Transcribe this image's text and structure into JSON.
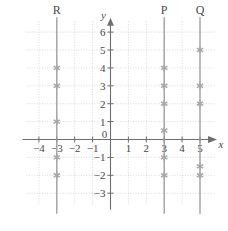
{
  "chart_data": {
    "type": "scatter",
    "title": "",
    "xlabel": "x",
    "ylabel": "y",
    "xlim": [
      -4.7,
      5.9
    ],
    "ylim": [
      -3.7,
      6.6
    ],
    "grid": true,
    "legend_position": "above-lines",
    "x_ticks": [
      -4,
      -3,
      -2,
      -1,
      0,
      1,
      2,
      3,
      4,
      5
    ],
    "x_tick_labels": [
      "−4",
      "−3",
      "−2",
      "−1",
      "0",
      "1",
      "2",
      "3",
      "4",
      "5"
    ],
    "y_ticks": [
      -3,
      -2,
      -1,
      1,
      2,
      3,
      4,
      5,
      6
    ],
    "y_tick_labels": [
      "−3",
      "−2",
      "−1",
      "1",
      "2",
      "3",
      "4",
      "5",
      "6"
    ],
    "series": [
      {
        "name": "R",
        "label": "R",
        "line_x": -3,
        "label_y": 6.6,
        "points": [
          {
            "x": -3,
            "y": 4
          },
          {
            "x": -3,
            "y": 3
          },
          {
            "x": -3,
            "y": 1
          },
          {
            "x": -3,
            "y": -1
          },
          {
            "x": -3,
            "y": -2
          }
        ]
      },
      {
        "name": "P",
        "label": "P",
        "line_x": 3,
        "label_y": 6.6,
        "points": [
          {
            "x": 3,
            "y": 4
          },
          {
            "x": 3,
            "y": 3
          },
          {
            "x": 3,
            "y": 2
          },
          {
            "x": 3,
            "y": 0.5
          },
          {
            "x": 3,
            "y": -1
          },
          {
            "x": 3,
            "y": -2
          }
        ]
      },
      {
        "name": "Q",
        "label": "Q",
        "line_x": 5,
        "label_y": 6.6,
        "points": [
          {
            "x": 5,
            "y": 5
          },
          {
            "x": 5,
            "y": 3
          },
          {
            "x": 5,
            "y": 2
          },
          {
            "x": 5,
            "y": -1.5
          },
          {
            "x": 5,
            "y": -2
          }
        ]
      }
    ],
    "colors": {
      "axis": "#6e6e6e",
      "grid": "#c9c9c9",
      "vertical_line": "#9a9a9a",
      "marker": "#a8a8a8",
      "text": "#4a4a4a",
      "background": "#ffffff"
    }
  }
}
